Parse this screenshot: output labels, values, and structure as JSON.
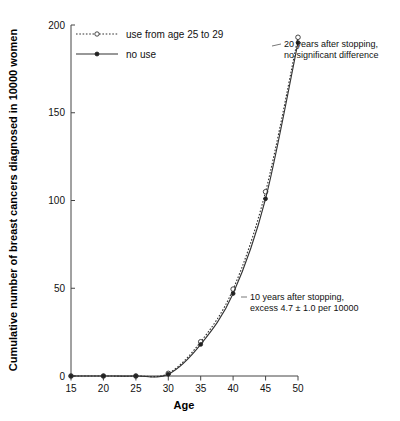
{
  "chart_data": {
    "type": "line",
    "title": "",
    "xlabel": "Age",
    "ylabel": "Cumulative number of breast cancers diagnosed in 10000 women",
    "x": [
      15,
      20,
      25,
      30,
      35,
      40,
      45,
      50
    ],
    "xlim": [
      15,
      50
    ],
    "ylim": [
      0,
      200
    ],
    "xticks": [
      "15",
      "20",
      "25",
      "30",
      "35",
      "40",
      "45",
      "50"
    ],
    "yticks": [
      "0",
      "50",
      "100",
      "150",
      "200"
    ],
    "ytick_values": [
      0,
      50,
      100,
      150,
      200
    ],
    "grid": false,
    "legend_position": "top-left",
    "series": [
      {
        "name": "use from age 25 to 29",
        "style": "dotted",
        "marker": "open-circle",
        "values": [
          0,
          0,
          0,
          1.5,
          19.5,
          49.5,
          105,
          193
        ]
      },
      {
        "name": "no use",
        "style": "solid",
        "marker": "filled-circle",
        "values": [
          0,
          0,
          0,
          1.0,
          18,
          47,
          101,
          190
        ]
      }
    ],
    "annotations": [
      {
        "id": "annotation-20-years",
        "lines": [
          "20 years after stopping,",
          "no significant difference"
        ],
        "anchor_x": 50,
        "anchor_y": 193
      },
      {
        "id": "annotation-10-years",
        "lines": [
          "10 years after stopping,",
          "excess 4.7 ± 1.0 per 10000"
        ],
        "anchor_x": 40,
        "anchor_y": 47
      }
    ]
  },
  "legend": {
    "items": [
      {
        "label": "use from age 25 to 29",
        "style": "dotted",
        "marker": "open-circle"
      },
      {
        "label": "no use",
        "style": "solid",
        "marker": "filled-circle"
      }
    ]
  },
  "axes": {
    "x_title": "Age",
    "y_title": "Cumulative number of breast cancers diagnosed in 10000 women",
    "x_tick_labels": [
      "15",
      "20",
      "25",
      "30",
      "35",
      "40",
      "45",
      "50"
    ],
    "y_tick_labels": [
      "0",
      "50",
      "100",
      "150",
      "200"
    ]
  },
  "annotations": {
    "top_right": {
      "line1": "20 years after stopping,",
      "line2": "no significant difference"
    },
    "middle": {
      "line1": "10 years after stopping,",
      "line2": "excess 4.7 ± 1.0 per 10000"
    }
  },
  "colors": {
    "axis": "#444444",
    "line": "#333333",
    "text": "#111111",
    "background": "#ffffff"
  }
}
